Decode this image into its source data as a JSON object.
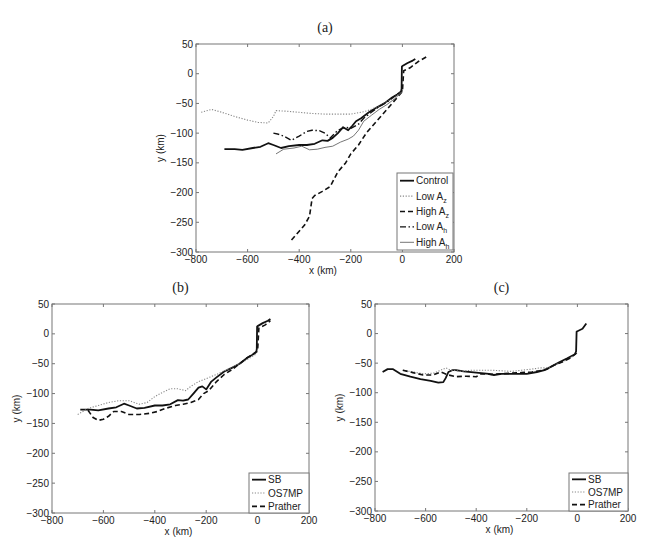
{
  "chart_data": [
    {
      "panel": "(a)",
      "type": "line",
      "xlabel": "x (km)",
      "ylabel": "y (km)",
      "xlim": [
        -800,
        200
      ],
      "ylim": [
        -300,
        50
      ],
      "xticks": [
        -800,
        -600,
        -400,
        -200,
        0,
        200
      ],
      "yticks": [
        50,
        0,
        -50,
        -100,
        -150,
        -200,
        -250,
        -300
      ],
      "grid": false,
      "legend_position": "lower right",
      "series": [
        {
          "name": "Control",
          "style": "solid-thick",
          "x": [
            -690,
            -650,
            -620,
            -580,
            -550,
            -520,
            -500,
            -470,
            -440,
            -400,
            -370,
            -340,
            -310,
            -290,
            -270,
            -250,
            -230,
            -210,
            -195,
            -180,
            -160,
            -130,
            -100,
            -70,
            -40,
            -20,
            -5,
            -3,
            -2,
            0,
            20,
            40,
            50
          ],
          "y": [
            -127,
            -127,
            -128,
            -125,
            -123,
            -117,
            -120,
            -125,
            -122,
            -120,
            -120,
            -118,
            -112,
            -113,
            -108,
            -100,
            -90,
            -95,
            -88,
            -80,
            -75,
            -65,
            -57,
            -50,
            -40,
            -35,
            -30,
            -25,
            12,
            13,
            18,
            22,
            25
          ]
        },
        {
          "name": "Low A_z",
          "style": "dotted",
          "x": [
            -780,
            -740,
            -700,
            -650,
            -600,
            -560,
            -520,
            -500,
            -490,
            -450,
            -400,
            -350,
            -300,
            -250,
            -200,
            -150,
            -120,
            -80,
            -40,
            -10,
            0
          ],
          "y": [
            -65,
            -60,
            -65,
            -72,
            -78,
            -82,
            -83,
            -72,
            -62,
            -63,
            -65,
            -67,
            -68,
            -68,
            -68,
            -64,
            -60,
            -52,
            -42,
            -33,
            -30
          ]
        },
        {
          "name": "High A_z",
          "style": "dashed-thick",
          "x": [
            -430,
            -400,
            -380,
            -360,
            -350,
            -340,
            -310,
            -280,
            -250,
            -220,
            -200,
            -170,
            -140,
            -110,
            -80,
            -50,
            -20,
            0,
            5,
            30,
            60,
            100
          ],
          "y": [
            -280,
            -265,
            -255,
            -240,
            -210,
            -205,
            -198,
            -190,
            -165,
            -150,
            -135,
            -120,
            -100,
            -85,
            -70,
            -55,
            -40,
            -30,
            5,
            10,
            20,
            30
          ]
        },
        {
          "name": "Low A_h",
          "style": "dashdot",
          "x": [
            -500,
            -480,
            -460,
            -430,
            -400,
            -370,
            -350,
            -320,
            -300,
            -280,
            -250,
            -220,
            -200,
            -170,
            -150,
            -120,
            -90,
            -60,
            -30,
            0
          ],
          "y": [
            -100,
            -102,
            -105,
            -112,
            -105,
            -97,
            -95,
            -96,
            -100,
            -108,
            -95,
            -90,
            -92,
            -85,
            -75,
            -65,
            -55,
            -48,
            -38,
            -28
          ]
        },
        {
          "name": "High A_h",
          "style": "thin",
          "x": [
            -490,
            -460,
            -420,
            -390,
            -360,
            -330,
            -300,
            -270,
            -240,
            -210,
            -190,
            -170,
            -150,
            -120,
            -90,
            -60,
            -30,
            0
          ],
          "y": [
            -135,
            -127,
            -125,
            -122,
            -128,
            -127,
            -124,
            -122,
            -115,
            -110,
            -105,
            -95,
            -80,
            -70,
            -60,
            -52,
            -42,
            -30
          ]
        }
      ]
    },
    {
      "panel": "(b)",
      "type": "line",
      "xlabel": "x (km)",
      "ylabel": "y (km)",
      "xlim": [
        -800,
        200
      ],
      "ylim": [
        -300,
        50
      ],
      "xticks": [
        -800,
        -600,
        -400,
        -200,
        0,
        200
      ],
      "yticks": [
        50,
        0,
        -50,
        -100,
        -150,
        -200,
        -250,
        -300
      ],
      "grid": false,
      "legend_position": "lower right",
      "series": [
        {
          "name": "SB",
          "style": "solid-thick",
          "x": [
            -690,
            -650,
            -620,
            -580,
            -550,
            -520,
            -500,
            -470,
            -440,
            -400,
            -370,
            -340,
            -310,
            -290,
            -270,
            -250,
            -230,
            -215,
            -200,
            -180,
            -160,
            -130,
            -100,
            -70,
            -40,
            -20,
            -5,
            -3,
            -2,
            0,
            20,
            40,
            50
          ],
          "y": [
            -127,
            -127,
            -128,
            -125,
            -123,
            -117,
            -120,
            -125,
            -124,
            -120,
            -120,
            -118,
            -111,
            -112,
            -110,
            -100,
            -90,
            -88,
            -93,
            -80,
            -73,
            -63,
            -57,
            -50,
            -40,
            -35,
            -30,
            -25,
            12,
            13,
            18,
            22,
            25
          ]
        },
        {
          "name": "OS7MP",
          "style": "dotted",
          "x": [
            -700,
            -660,
            -620,
            -580,
            -540,
            -500,
            -460,
            -430,
            -400,
            -370,
            -340,
            -310,
            -280,
            -260,
            -230,
            -200,
            -160,
            -120,
            -80,
            -40,
            -10,
            0
          ],
          "y": [
            -135,
            -125,
            -120,
            -115,
            -112,
            -112,
            -118,
            -115,
            -105,
            -98,
            -92,
            -92,
            -95,
            -88,
            -80,
            -75,
            -68,
            -60,
            -52,
            -43,
            -35,
            -30
          ]
        },
        {
          "name": "Prather",
          "style": "dashed-thick",
          "x": [
            -660,
            -640,
            -620,
            -600,
            -580,
            -560,
            -530,
            -500,
            -460,
            -420,
            -390,
            -360,
            -320,
            -290,
            -260,
            -230,
            -210,
            -190,
            -160,
            -130,
            -100,
            -70,
            -40,
            -10,
            0,
            5,
            30,
            50
          ],
          "y": [
            -128,
            -140,
            -145,
            -143,
            -138,
            -130,
            -130,
            -135,
            -135,
            -133,
            -130,
            -125,
            -120,
            -118,
            -115,
            -110,
            -100,
            -95,
            -80,
            -68,
            -60,
            -50,
            -40,
            -32,
            -28,
            10,
            15,
            22
          ]
        }
      ]
    },
    {
      "panel": "(c)",
      "type": "line",
      "xlabel": "x (km)",
      "ylabel": "y (km)",
      "xlim": [
        -800,
        200
      ],
      "ylim": [
        -300,
        50
      ],
      "xticks": [
        -800,
        -600,
        -400,
        -200,
        0,
        200
      ],
      "yticks": [
        50,
        0,
        -50,
        -100,
        -150,
        -200,
        -250,
        -300
      ],
      "grid": false,
      "legend_position": "lower right",
      "series": [
        {
          "name": "SB",
          "style": "solid-thick",
          "x": [
            -770,
            -750,
            -730,
            -700,
            -660,
            -620,
            -580,
            -550,
            -530,
            -520,
            -510,
            -495,
            -480,
            -450,
            -400,
            -350,
            -330,
            -300,
            -250,
            -200,
            -160,
            -130,
            -100,
            -70,
            -40,
            -10,
            -5,
            -3,
            0,
            20,
            35
          ],
          "y": [
            -65,
            -60,
            -60,
            -68,
            -73,
            -77,
            -80,
            -83,
            -82,
            -75,
            -65,
            -62,
            -62,
            -64,
            -66,
            -68,
            -70,
            -68,
            -68,
            -68,
            -65,
            -62,
            -55,
            -48,
            -42,
            -35,
            -30,
            3,
            4,
            8,
            17
          ]
        },
        {
          "name": "OS7MP",
          "style": "dotted",
          "x": [
            -690,
            -650,
            -610,
            -570,
            -540,
            -520,
            -500,
            -460,
            -420,
            -380,
            -340,
            -300,
            -260,
            -220,
            -180,
            -150,
            -120,
            -90,
            -60,
            -30,
            0
          ],
          "y": [
            -62,
            -65,
            -68,
            -67,
            -62,
            -58,
            -62,
            -64,
            -62,
            -62,
            -62,
            -63,
            -64,
            -62,
            -60,
            -58,
            -58,
            -53,
            -48,
            -42,
            -32
          ]
        },
        {
          "name": "Prather",
          "style": "dashed-thick",
          "x": [
            -690,
            -650,
            -610,
            -570,
            -540,
            -510,
            -480,
            -440,
            -400,
            -380,
            -340,
            -300,
            -260,
            -220,
            -180,
            -150,
            -120,
            -90,
            -60,
            -30,
            0
          ],
          "y": [
            -62,
            -66,
            -70,
            -70,
            -65,
            -70,
            -73,
            -72,
            -73,
            -68,
            -69,
            -68,
            -67,
            -66,
            -65,
            -63,
            -60,
            -53,
            -48,
            -42,
            -32
          ]
        }
      ]
    }
  ],
  "panels": {
    "a": {
      "title": "(a)",
      "xlabel": "x (km)",
      "ylabel": "y (km)",
      "legend": [
        "Control",
        "Low A",
        "High A",
        "Low A",
        "High A"
      ],
      "legend_sub": [
        "",
        "z",
        "z",
        "h",
        "h"
      ]
    },
    "b": {
      "title": "(b)",
      "xlabel": "x (km)",
      "ylabel": "y (km)",
      "legend": [
        "SB",
        "OS7MP",
        "Prather"
      ]
    },
    "c": {
      "title": "(c)",
      "xlabel": "x (km)",
      "ylabel": "y (km)",
      "legend": [
        "SB",
        "OS7MP",
        "Prather"
      ]
    }
  },
  "colors": {
    "axis": "#777777",
    "line": "#111111",
    "dotted": "#888888",
    "thin": "#666666"
  }
}
